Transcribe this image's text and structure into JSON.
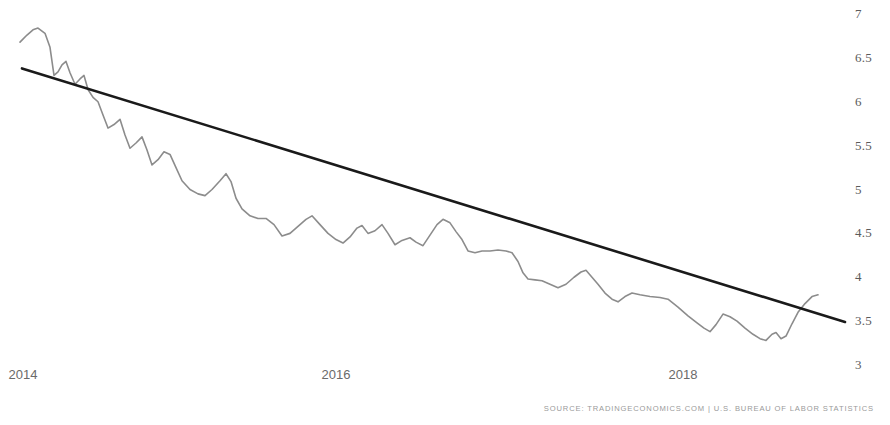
{
  "footer": {
    "source_text": "SOURCE: TRADINGECONOMICS.COM | U.S. BUREAU OF LABOR STATISTICS"
  },
  "style": {
    "series_color": "#8c8c8c",
    "trend_color": "#1a1a1a",
    "axis_label_color": "#5b5b5b",
    "background": "#ffffff"
  },
  "chart_data": {
    "type": "line",
    "title": "",
    "subtitle": "",
    "xlabel": "",
    "ylabel": "",
    "grid": false,
    "legend": false,
    "legend_position": "none",
    "xlim": [
      2013.85,
      2019.0
    ],
    "ylim": [
      3,
      7
    ],
    "ytick_labels": [
      "7",
      "6.5",
      "6",
      "5.5",
      "5",
      "4.5",
      "4",
      "3.5",
      "3"
    ],
    "yticks": [
      7,
      6.5,
      6,
      5.5,
      5,
      4.5,
      4,
      3.5,
      3
    ],
    "xtick_labels": [
      "2014",
      "2016",
      "2018"
    ],
    "xticks": [
      2014,
      2016,
      2018
    ],
    "series": [
      {
        "name": "Unemployment Rate",
        "color": "#8c8c8c",
        "points": [
          [
            20,
            6.68
          ],
          [
            27,
            6.76
          ],
          [
            33,
            6.82
          ],
          [
            38,
            6.84
          ],
          [
            45,
            6.78
          ],
          [
            50,
            6.62
          ],
          [
            54,
            6.3
          ],
          [
            58,
            6.34
          ],
          [
            62,
            6.42
          ],
          [
            66,
            6.46
          ],
          [
            70,
            6.33
          ],
          [
            75,
            6.2
          ],
          [
            80,
            6.26
          ],
          [
            84,
            6.3
          ],
          [
            88,
            6.14
          ],
          [
            93,
            6.05
          ],
          [
            98,
            6.0
          ],
          [
            103,
            5.85
          ],
          [
            108,
            5.7
          ],
          [
            114,
            5.74
          ],
          [
            120,
            5.8
          ],
          [
            125,
            5.62
          ],
          [
            130,
            5.47
          ],
          [
            136,
            5.53
          ],
          [
            142,
            5.6
          ],
          [
            147,
            5.45
          ],
          [
            152,
            5.28
          ],
          [
            158,
            5.34
          ],
          [
            164,
            5.43
          ],
          [
            170,
            5.4
          ],
          [
            176,
            5.25
          ],
          [
            182,
            5.1
          ],
          [
            190,
            5.0
          ],
          [
            198,
            4.95
          ],
          [
            205,
            4.93
          ],
          [
            212,
            5.0
          ],
          [
            220,
            5.1
          ],
          [
            226,
            5.18
          ],
          [
            231,
            5.09
          ],
          [
            236,
            4.9
          ],
          [
            242,
            4.78
          ],
          [
            250,
            4.7
          ],
          [
            258,
            4.67
          ],
          [
            266,
            4.67
          ],
          [
            274,
            4.6
          ],
          [
            282,
            4.47
          ],
          [
            290,
            4.5
          ],
          [
            298,
            4.58
          ],
          [
            306,
            4.66
          ],
          [
            312,
            4.7
          ],
          [
            320,
            4.6
          ],
          [
            328,
            4.5
          ],
          [
            336,
            4.43
          ],
          [
            343,
            4.39
          ],
          [
            350,
            4.46
          ],
          [
            357,
            4.56
          ],
          [
            362,
            4.59
          ],
          [
            368,
            4.5
          ],
          [
            375,
            4.53
          ],
          [
            382,
            4.6
          ],
          [
            388,
            4.5
          ],
          [
            395,
            4.37
          ],
          [
            402,
            4.42
          ],
          [
            410,
            4.45
          ],
          [
            416,
            4.4
          ],
          [
            423,
            4.36
          ],
          [
            430,
            4.48
          ],
          [
            437,
            4.6
          ],
          [
            443,
            4.66
          ],
          [
            450,
            4.62
          ],
          [
            456,
            4.52
          ],
          [
            462,
            4.43
          ],
          [
            468,
            4.3
          ],
          [
            475,
            4.28
          ],
          [
            482,
            4.3
          ],
          [
            490,
            4.3
          ],
          [
            498,
            4.31
          ],
          [
            506,
            4.3
          ],
          [
            512,
            4.28
          ],
          [
            518,
            4.18
          ],
          [
            523,
            4.05
          ],
          [
            528,
            3.98
          ],
          [
            535,
            3.97
          ],
          [
            542,
            3.96
          ],
          [
            550,
            3.92
          ],
          [
            558,
            3.88
          ],
          [
            566,
            3.92
          ],
          [
            574,
            4.0
          ],
          [
            581,
            4.06
          ],
          [
            586,
            4.08
          ],
          [
            592,
            4.0
          ],
          [
            598,
            3.92
          ],
          [
            605,
            3.82
          ],
          [
            612,
            3.75
          ],
          [
            618,
            3.72
          ],
          [
            625,
            3.78
          ],
          [
            632,
            3.82
          ],
          [
            640,
            3.8
          ],
          [
            650,
            3.78
          ],
          [
            660,
            3.77
          ],
          [
            668,
            3.75
          ],
          [
            678,
            3.66
          ],
          [
            688,
            3.56
          ],
          [
            697,
            3.48
          ],
          [
            704,
            3.42
          ],
          [
            710,
            3.38
          ],
          [
            716,
            3.46
          ],
          [
            723,
            3.58
          ],
          [
            730,
            3.55
          ],
          [
            737,
            3.5
          ],
          [
            745,
            3.42
          ],
          [
            753,
            3.35
          ],
          [
            760,
            3.3
          ],
          [
            766,
            3.28
          ],
          [
            772,
            3.35
          ],
          [
            776,
            3.37
          ],
          [
            781,
            3.3
          ],
          [
            786,
            3.33
          ],
          [
            792,
            3.47
          ],
          [
            798,
            3.6
          ],
          [
            805,
            3.7
          ],
          [
            812,
            3.78
          ],
          [
            818,
            3.8
          ]
        ]
      }
    ],
    "trendline": {
      "name": "Linear trend",
      "color": "#1a1a1a",
      "start": [
        22,
        6.38
      ],
      "end": [
        845,
        3.49
      ]
    },
    "annotations": []
  }
}
